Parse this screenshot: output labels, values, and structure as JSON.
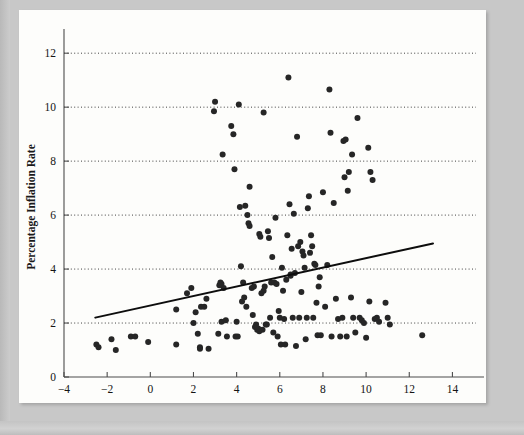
{
  "figure": {
    "panel_background": "#fdfdfb",
    "page_background": "#c8c8c8",
    "point_color": "#262626",
    "trend_color": "#0d0d0d",
    "grid_color": "#2b2b2b",
    "axis_color": "#4c4c4c"
  },
  "chart_data": {
    "type": "scatter",
    "title": "",
    "subtitle": "",
    "xlabel": "Percentage Money Growth Rate",
    "ylabel": "Percentage Inflation Rate",
    "xlim": [
      -4,
      15
    ],
    "ylim": [
      0,
      12.6
    ],
    "xticks": [
      -4,
      -2,
      0,
      2,
      4,
      6,
      8,
      10,
      12,
      14
    ],
    "xticklabels": [
      "−4",
      "−2",
      "0",
      "2",
      "4",
      "6",
      "8",
      "10",
      "12",
      "14"
    ],
    "yticks": [
      0,
      2,
      4,
      6,
      8,
      10,
      12
    ],
    "yticklabels": [
      "0",
      "2",
      "4",
      "6",
      "8",
      "10",
      "12"
    ],
    "grid": "horizontal-dotted",
    "gridlines_y": [
      2,
      4,
      6,
      8,
      10,
      12
    ],
    "legend": null,
    "legend_position": "none",
    "annotations": [],
    "series": [
      {
        "name": "Countries",
        "marker": "filled-circle",
        "marker_radius_px": 3.0,
        "points": [
          [
            -2.5,
            1.2
          ],
          [
            -2.4,
            1.1
          ],
          [
            -1.8,
            1.4
          ],
          [
            -1.6,
            1.0
          ],
          [
            -0.9,
            1.5
          ],
          [
            -0.7,
            1.5
          ],
          [
            -0.1,
            1.3
          ],
          [
            1.2,
            1.2
          ],
          [
            1.2,
            2.5
          ],
          [
            1.7,
            3.1
          ],
          [
            1.9,
            3.3
          ],
          [
            2.0,
            2.0
          ],
          [
            2.1,
            2.4
          ],
          [
            2.2,
            1.6
          ],
          [
            2.3,
            1.1
          ],
          [
            2.3,
            1.05
          ],
          [
            2.35,
            2.6
          ],
          [
            2.5,
            2.6
          ],
          [
            2.6,
            2.9
          ],
          [
            2.7,
            1.05
          ],
          [
            2.95,
            9.85
          ],
          [
            3.0,
            10.2
          ],
          [
            3.15,
            1.6
          ],
          [
            3.2,
            3.4
          ],
          [
            3.25,
            3.5
          ],
          [
            3.3,
            3.45
          ],
          [
            3.3,
            2.05
          ],
          [
            3.35,
            8.25
          ],
          [
            3.4,
            3.3
          ],
          [
            3.5,
            2.1
          ],
          [
            3.55,
            1.5
          ],
          [
            3.75,
            9.3
          ],
          [
            3.85,
            9.0
          ],
          [
            3.9,
            7.7
          ],
          [
            3.95,
            1.5
          ],
          [
            4.0,
            2.05
          ],
          [
            4.05,
            1.5
          ],
          [
            4.1,
            10.1
          ],
          [
            4.15,
            6.3
          ],
          [
            4.2,
            4.1
          ],
          [
            4.25,
            2.8
          ],
          [
            4.3,
            3.5
          ],
          [
            4.35,
            2.95
          ],
          [
            4.4,
            6.35
          ],
          [
            4.45,
            2.6
          ],
          [
            4.5,
            6.0
          ],
          [
            4.55,
            5.7
          ],
          [
            4.6,
            5.6
          ],
          [
            4.6,
            7.05
          ],
          [
            4.7,
            3.3
          ],
          [
            4.75,
            2.3
          ],
          [
            4.8,
            3.35
          ],
          [
            4.85,
            1.85
          ],
          [
            4.9,
            1.95
          ],
          [
            4.95,
            1.75
          ],
          [
            5.0,
            1.8
          ],
          [
            5.05,
            1.7
          ],
          [
            5.05,
            5.3
          ],
          [
            5.1,
            5.2
          ],
          [
            5.15,
            3.1
          ],
          [
            5.2,
            1.75
          ],
          [
            5.25,
            9.8
          ],
          [
            5.25,
            3.2
          ],
          [
            5.3,
            3.35
          ],
          [
            5.35,
            1.95
          ],
          [
            5.4,
            1.95
          ],
          [
            5.45,
            5.4
          ],
          [
            5.5,
            5.15
          ],
          [
            5.55,
            2.2
          ],
          [
            5.6,
            3.5
          ],
          [
            5.65,
            4.45
          ],
          [
            5.7,
            1.65
          ],
          [
            5.75,
            3.5
          ],
          [
            5.8,
            5.9
          ],
          [
            5.85,
            3.45
          ],
          [
            5.9,
            1.5
          ],
          [
            5.95,
            2.45
          ],
          [
            6.0,
            2.2
          ],
          [
            6.05,
            1.2
          ],
          [
            6.1,
            4.05
          ],
          [
            6.15,
            3.2
          ],
          [
            6.2,
            2.15
          ],
          [
            6.25,
            1.2
          ],
          [
            6.3,
            3.6
          ],
          [
            6.35,
            5.25
          ],
          [
            6.4,
            11.1
          ],
          [
            6.45,
            6.4
          ],
          [
            6.5,
            3.8
          ],
          [
            6.5,
            3.75
          ],
          [
            6.55,
            4.75
          ],
          [
            6.6,
            2.2
          ],
          [
            6.65,
            6.05
          ],
          [
            6.7,
            3.85
          ],
          [
            6.75,
            1.15
          ],
          [
            6.8,
            8.9
          ],
          [
            6.85,
            4.85
          ],
          [
            6.9,
            2.2
          ],
          [
            6.95,
            5.0
          ],
          [
            7.0,
            3.15
          ],
          [
            7.05,
            4.65
          ],
          [
            7.1,
            4.5
          ],
          [
            7.15,
            4.05
          ],
          [
            7.2,
            1.4
          ],
          [
            7.25,
            2.2
          ],
          [
            7.3,
            6.25
          ],
          [
            7.35,
            6.7
          ],
          [
            7.4,
            4.6
          ],
          [
            7.45,
            5.25
          ],
          [
            7.5,
            4.85
          ],
          [
            7.55,
            2.2
          ],
          [
            7.6,
            4.2
          ],
          [
            7.65,
            4.15
          ],
          [
            7.7,
            2.75
          ],
          [
            7.75,
            1.55
          ],
          [
            7.8,
            3.35
          ],
          [
            7.85,
            3.7
          ],
          [
            7.9,
            1.55
          ],
          [
            8.0,
            6.85
          ],
          [
            8.1,
            2.6
          ],
          [
            8.2,
            4.15
          ],
          [
            8.3,
            10.65
          ],
          [
            8.35,
            9.05
          ],
          [
            8.4,
            1.5
          ],
          [
            8.5,
            6.45
          ],
          [
            8.6,
            2.9
          ],
          [
            8.7,
            2.15
          ],
          [
            8.8,
            1.5
          ],
          [
            8.9,
            2.2
          ],
          [
            8.95,
            8.75
          ],
          [
            9.0,
            7.4
          ],
          [
            9.05,
            8.8
          ],
          [
            9.1,
            1.5
          ],
          [
            9.15,
            6.9
          ],
          [
            9.2,
            7.6
          ],
          [
            9.3,
            2.95
          ],
          [
            9.35,
            8.25
          ],
          [
            9.4,
            2.2
          ],
          [
            9.5,
            1.65
          ],
          [
            9.6,
            9.6
          ],
          [
            9.7,
            2.2
          ],
          [
            9.8,
            2.1
          ],
          [
            9.9,
            2.0
          ],
          [
            10.0,
            1.45
          ],
          [
            10.1,
            8.5
          ],
          [
            10.15,
            2.8
          ],
          [
            10.2,
            7.6
          ],
          [
            10.3,
            7.3
          ],
          [
            10.4,
            2.15
          ],
          [
            10.5,
            2.2
          ],
          [
            10.6,
            2.05
          ],
          [
            10.9,
            2.75
          ],
          [
            11.0,
            2.2
          ],
          [
            11.1,
            1.95
          ],
          [
            12.6,
            1.55
          ]
        ]
      }
    ],
    "trend_line": {
      "name": "fitted regression line",
      "x_start": -2.55,
      "y_start": 2.2,
      "x_end": 13.1,
      "y_end": 4.95
    }
  }
}
